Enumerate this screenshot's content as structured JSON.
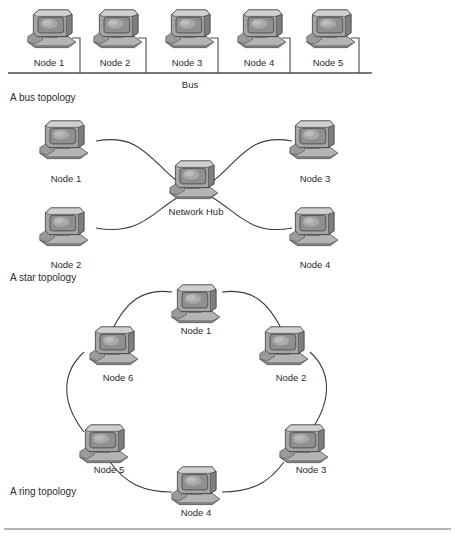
{
  "figure": {
    "type": "diagram",
    "background_color": "#ffffff",
    "line_color": "#3a3a3a",
    "icon_name": "crt-computer-icon"
  },
  "sections": [
    {
      "id": "bus",
      "caption": "A bus topology",
      "bus_label": "Bus",
      "nodes": [
        {
          "label": "Node 1"
        },
        {
          "label": "Node 2"
        },
        {
          "label": "Node 3"
        },
        {
          "label": "Node 4"
        },
        {
          "label": "Node 5"
        }
      ]
    },
    {
      "id": "star",
      "caption": "A star topology",
      "hub_label": "Network Hub",
      "nodes": [
        {
          "label": "Node 1"
        },
        {
          "label": "Node 2"
        },
        {
          "label": "Node 3"
        },
        {
          "label": "Node 4"
        }
      ]
    },
    {
      "id": "ring",
      "caption": "A ring topology",
      "nodes": [
        {
          "label": "Node 1"
        },
        {
          "label": "Node 2"
        },
        {
          "label": "Node 3"
        },
        {
          "label": "Node 4"
        },
        {
          "label": "Node 5"
        },
        {
          "label": "Node 6"
        }
      ]
    }
  ]
}
